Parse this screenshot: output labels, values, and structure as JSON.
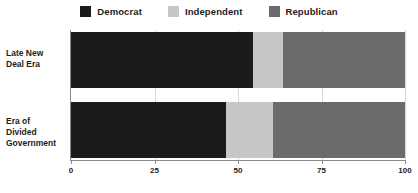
{
  "chart_data": {
    "type": "bar",
    "orientation": "horizontal",
    "stacked": true,
    "percent": true,
    "title": "",
    "subtitle": "",
    "xlabel": "",
    "ylabel": "",
    "xlim": [
      0,
      100
    ],
    "xticks": [
      0,
      25,
      50,
      75,
      100
    ],
    "xtick_labels": [
      "0",
      "25",
      "50",
      "75",
      "100"
    ],
    "grid": true,
    "grid_axis": "x",
    "legend_position": "top-center",
    "categories": [
      "Late New Deal Era",
      "Era of Divided Government"
    ],
    "category_lines": [
      [
        "Late New",
        "Deal Era"
      ],
      [
        "Era of",
        "Divided",
        "Government"
      ]
    ],
    "series": [
      {
        "name": "Democrat",
        "color": "#1b1b1b",
        "values": [
          54.5,
          46.5
        ]
      },
      {
        "name": "Independent",
        "color": "#c7c7c7",
        "values": [
          9.0,
          14.0
        ]
      },
      {
        "name": "Republican",
        "color": "#6b6b6b",
        "values": [
          36.5,
          39.5
        ]
      }
    ],
    "cumulative_boundaries": [
      [
        54.5,
        63.5,
        100
      ],
      [
        46.5,
        60.5,
        100
      ]
    ]
  },
  "legend": {
    "items": [
      {
        "label": "Democrat",
        "color": "#1b1b1b"
      },
      {
        "label": "Independent",
        "color": "#c7c7c7"
      },
      {
        "label": "Republican",
        "color": "#6b6b6b"
      }
    ]
  },
  "axis": {
    "tick_labels": [
      "0",
      "25",
      "50",
      "75",
      "100"
    ]
  },
  "colors": {
    "background": "#ffffff",
    "axis": "#8a8a8a",
    "grid": "#d8d8d8",
    "text": "#1d1d1d"
  }
}
